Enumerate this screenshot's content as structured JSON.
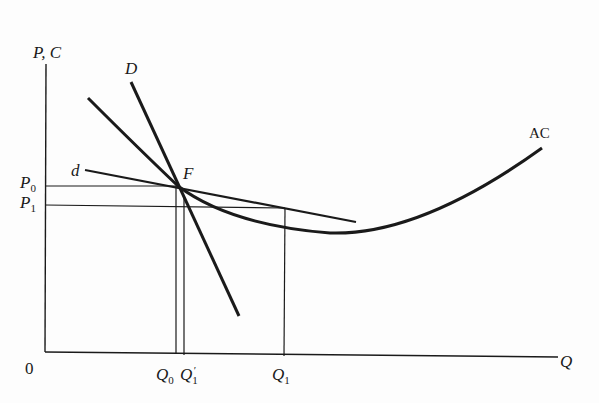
{
  "diagram": {
    "type": "economics-cost-demand",
    "axes": {
      "y_label": "P, C",
      "x_label": "Q",
      "origin_label": "0"
    },
    "price_levels": [
      {
        "id": "P0",
        "base": "P",
        "sub": "0"
      },
      {
        "id": "P1",
        "base": "P",
        "sub": "1"
      }
    ],
    "quantity_levels": [
      {
        "id": "Q0",
        "base": "Q",
        "sub": "0"
      },
      {
        "id": "Q1prime",
        "base": "Q",
        "sub": "1",
        "prime": "′"
      },
      {
        "id": "Q1",
        "base": "Q",
        "sub": "1"
      }
    ],
    "curves": {
      "D": "D",
      "d": "d",
      "AC": "AC"
    },
    "point_label": "F",
    "colors": {
      "ink": "#1a1a1a",
      "background": "#fdfdfd"
    }
  }
}
